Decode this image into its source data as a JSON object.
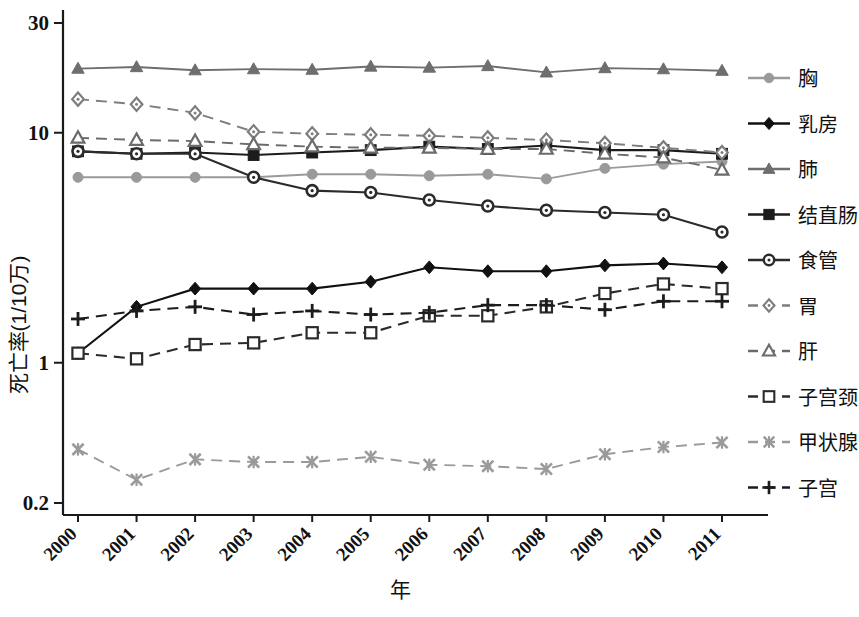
{
  "chart_data": {
    "type": "line",
    "title": "",
    "xlabel": "年",
    "ylabel": "死亡率(1/10万)",
    "x": [
      2000,
      2001,
      2002,
      2003,
      2004,
      2005,
      2006,
      2007,
      2008,
      2009,
      2010,
      2011
    ],
    "categories": [
      "2000",
      "2001",
      "2002",
      "2003",
      "2004",
      "2005",
      "2006",
      "2007",
      "2008",
      "2009",
      "2010",
      "2011"
    ],
    "yscale": "log",
    "ylim": [
      0.2,
      30
    ],
    "ytick_labels": [
      "30",
      "10",
      "1",
      "0.2"
    ],
    "ytick_values": [
      30,
      10,
      1,
      0.2
    ],
    "grid": false,
    "legend_position": "right",
    "series": [
      {
        "name": "胸",
        "marker": "circle",
        "dash": "solid",
        "color": "#9a9a9a",
        "values": [
          6.4,
          6.4,
          6.4,
          6.4,
          6.6,
          6.6,
          6.5,
          6.6,
          6.3,
          7.0,
          7.3,
          7.5
        ]
      },
      {
        "name": "乳房",
        "marker": "diamond",
        "dash": "solid",
        "color": "#111111",
        "values": [
          1.1,
          1.75,
          2.1,
          2.1,
          2.1,
          2.25,
          2.6,
          2.5,
          2.5,
          2.65,
          2.7,
          2.6
        ]
      },
      {
        "name": "肺",
        "marker": "triangle",
        "dash": "solid",
        "color": "#6e6e6e",
        "values": [
          19.0,
          19.3,
          18.7,
          18.9,
          18.8,
          19.4,
          19.2,
          19.5,
          18.3,
          19.1,
          18.9,
          18.6
        ]
      },
      {
        "name": "结直肠",
        "marker": "square",
        "dash": "solid",
        "color": "#1c1c1c",
        "values": [
          8.3,
          8.1,
          8.2,
          8.0,
          8.2,
          8.4,
          8.7,
          8.5,
          8.8,
          8.4,
          8.4,
          8.1
        ]
      },
      {
        "name": "食管",
        "marker": "circle-dot",
        "dash": "solid",
        "color": "#2b2b2b",
        "values": [
          8.3,
          8.1,
          8.1,
          6.4,
          5.6,
          5.5,
          5.1,
          4.8,
          4.6,
          4.5,
          4.4,
          3.7
        ]
      },
      {
        "name": "胃",
        "marker": "diamond-open",
        "dash": "dashed",
        "color": "#7d7d7d",
        "values": [
          14.0,
          13.3,
          12.2,
          10.1,
          9.9,
          9.8,
          9.7,
          9.5,
          9.3,
          9.0,
          8.6,
          8.2
        ]
      },
      {
        "name": "肝",
        "marker": "triangle-open",
        "dash": "dashed",
        "color": "#6b6b6b",
        "values": [
          9.5,
          9.3,
          9.2,
          8.9,
          8.7,
          8.6,
          8.6,
          8.5,
          8.5,
          8.1,
          7.8,
          6.9
        ]
      },
      {
        "name": "子宫颈",
        "marker": "square-open",
        "dash": "dashed",
        "color": "#2b2b2b",
        "values": [
          1.1,
          1.04,
          1.2,
          1.22,
          1.35,
          1.35,
          1.6,
          1.6,
          1.75,
          2.0,
          2.2,
          2.1
        ]
      },
      {
        "name": "甲状腺",
        "marker": "star",
        "dash": "dashed",
        "color": "#9a9a9a",
        "values": [
          0.42,
          0.31,
          0.38,
          0.37,
          0.37,
          0.39,
          0.36,
          0.355,
          0.345,
          0.4,
          0.43,
          0.45
        ]
      },
      {
        "name": "子宫",
        "marker": "plus",
        "dash": "dashed",
        "color": "#1c1c1c",
        "values": [
          1.55,
          1.68,
          1.75,
          1.62,
          1.68,
          1.62,
          1.65,
          1.78,
          1.78,
          1.7,
          1.85,
          1.85
        ]
      }
    ]
  },
  "legend": {
    "items": [
      {
        "label": "胸"
      },
      {
        "label": "乳房"
      },
      {
        "label": "肺"
      },
      {
        "label": "结直肠"
      },
      {
        "label": "食管"
      },
      {
        "label": "胃"
      },
      {
        "label": "肝"
      },
      {
        "label": "子宫颈"
      },
      {
        "label": "甲状腺"
      },
      {
        "label": "子宫"
      }
    ]
  }
}
